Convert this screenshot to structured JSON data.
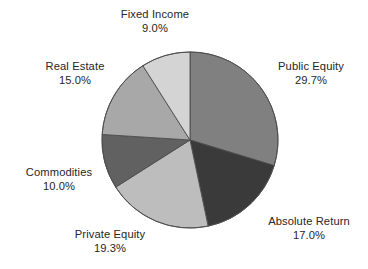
{
  "chart_data": {
    "type": "pie",
    "title": "",
    "subtitle": "",
    "xlabel": "",
    "ylabel": "",
    "legend_position": "none",
    "grid": false,
    "labels_outside": true,
    "start_angle_deg": 0,
    "direction": "clockwise",
    "units": "percent",
    "total": 100.0,
    "categories": [
      "Public Equity",
      "Absolute Return",
      "Private Equity",
      "Commodities",
      "Real Estate",
      "Fixed Income"
    ],
    "values": [
      29.7,
      17.0,
      19.3,
      10.0,
      15.0,
      9.0
    ],
    "value_labels": [
      "29.7%",
      "17.0%",
      "19.3%",
      "10.0%",
      "15.0%",
      "9.0%"
    ],
    "colors": [
      "#808080",
      "#3a3a3a",
      "#bdbdbd",
      "#616161",
      "#a8a8a8",
      "#d4d4d4"
    ],
    "slices": [
      {
        "id": "public-equity",
        "name": "Public Equity",
        "value": 29.7,
        "value_label": "29.7%",
        "color": "#808080",
        "start_angle_deg": 0.0,
        "end_angle_deg": 106.92
      },
      {
        "id": "absolute-return",
        "name": "Absolute Return",
        "value": 17.0,
        "value_label": "17.0%",
        "color": "#3a3a3a",
        "start_angle_deg": 106.92,
        "end_angle_deg": 168.12
      },
      {
        "id": "private-equity",
        "name": "Private Equity",
        "value": 19.3,
        "value_label": "19.3%",
        "color": "#bdbdbd",
        "start_angle_deg": 168.12,
        "end_angle_deg": 237.6
      },
      {
        "id": "commodities",
        "name": "Commodities",
        "value": 10.0,
        "value_label": "10.0%",
        "color": "#616161",
        "start_angle_deg": 237.6,
        "end_angle_deg": 273.6
      },
      {
        "id": "real-estate",
        "name": "Real Estate",
        "value": 15.0,
        "value_label": "15.0%",
        "color": "#a8a8a8",
        "start_angle_deg": 273.6,
        "end_angle_deg": 327.6
      },
      {
        "id": "fixed-income",
        "name": "Fixed Income",
        "value": 9.0,
        "value_label": "9.0%",
        "color": "#d4d4d4",
        "start_angle_deg": 327.6,
        "end_angle_deg": 360.0
      }
    ]
  },
  "geometry": {
    "center_x": 190,
    "center_y": 140,
    "radius": 88,
    "stroke_color": "#4d4d4d",
    "stroke_width": 0.9,
    "background": "#ffffff"
  },
  "labels": {
    "fixed_income": {
      "name": "Fixed Income",
      "value": "9.0%"
    },
    "public_equity": {
      "name": "Public Equity",
      "value": "29.7%"
    },
    "absolute_return": {
      "name": "Absolute Return",
      "value": "17.0%"
    },
    "private_equity": {
      "name": "Private Equity",
      "value": "19.3%"
    },
    "commodities": {
      "name": "Commodities",
      "value": "10.0%"
    },
    "real_estate": {
      "name": "Real Estate",
      "value": "15.0%"
    }
  }
}
